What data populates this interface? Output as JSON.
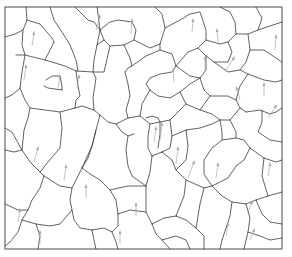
{
  "diagram": {
    "kind": "grain-boundary-microstructure",
    "frame": {
      "x": 5,
      "y": 7,
      "width": 277,
      "height": 242
    },
    "colors": {
      "boundary": "#3a3a3a",
      "arrow": "#a9a9a9",
      "background": "#ffffff"
    },
    "arrow_count": 22,
    "legend": "",
    "labels": []
  }
}
